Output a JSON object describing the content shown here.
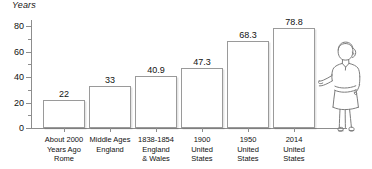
{
  "chart_data": {
    "type": "bar",
    "title": "",
    "subtitle": "",
    "xlabel": "",
    "ylabel": "Years",
    "ylim": [
      0,
      85
    ],
    "yticks": [
      0,
      20,
      40,
      60,
      80
    ],
    "yticks_minor": [
      10,
      30,
      50,
      70
    ],
    "ytick_labels": [
      "0",
      "20",
      "40",
      "60",
      "80"
    ],
    "grid": false,
    "legend": null,
    "categories": [
      "About 2000 Years Ago Rome",
      "Middle Ages England",
      "1838-1854 England & Wales",
      "1900 United States",
      "1950 United States",
      "2014 United States"
    ],
    "category_lines": [
      [
        "About 2000",
        "Years Ago",
        "Rome"
      ],
      [
        "Middle Ages",
        "England"
      ],
      [
        "1838-1854",
        "England",
        "& Wales"
      ],
      [
        "1900",
        "United",
        "States"
      ],
      [
        "1950",
        "United",
        "States"
      ],
      [
        "2014",
        "United",
        "States"
      ]
    ],
    "values": [
      22,
      33,
      40.9,
      47.3,
      68.3,
      78.8
    ],
    "value_labels": [
      "22",
      "33",
      "40.9",
      "47.3",
      "68.3",
      "78.8"
    ],
    "bar_fill": "#ffffff",
    "bar_stroke": "#9a9a9a",
    "axis_color": "#8d8d8d",
    "text_color": "#111111"
  },
  "illustration": {
    "name": "standing-woman-pointing",
    "description": "line drawing of a woman standing at right of chart with left arm extended toward the bars"
  }
}
